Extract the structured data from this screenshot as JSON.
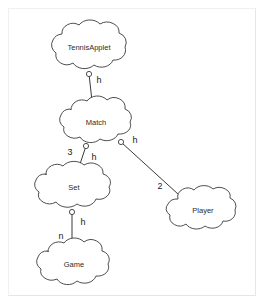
{
  "diagram": {
    "type": "cloud-class-diagram",
    "title": "",
    "background_color": "#ffffff",
    "stroke_color": "#3a3a3a",
    "text_color": "#2b2b2b",
    "nodes": [
      {
        "id": "tennisapplet",
        "label": "TennisApplet",
        "cx": 89,
        "cy": 48,
        "rx": 44,
        "ry": 24
      },
      {
        "id": "match",
        "label": "Match",
        "cx": 96,
        "cy": 123,
        "rx": 41,
        "ry": 23
      },
      {
        "id": "set",
        "label": "Set",
        "cx": 74,
        "cy": 188,
        "rx": 44,
        "ry": 23
      },
      {
        "id": "game",
        "label": "Game",
        "cx": 74,
        "cy": 265,
        "rx": 42,
        "ry": 23
      },
      {
        "id": "player",
        "label": "Player",
        "cx": 203,
        "cy": 211,
        "rx": 41,
        "ry": 22
      }
    ],
    "edges": [
      {
        "id": "tennisapplet-match",
        "from": "tennisapplet",
        "to": "match",
        "socket_label": "h",
        "multiplicity": ""
      },
      {
        "id": "match-set",
        "from": "match",
        "to": "set",
        "socket_label": "h",
        "multiplicity": "3"
      },
      {
        "id": "match-player",
        "from": "match",
        "to": "player",
        "socket_label": "h",
        "multiplicity": "2"
      },
      {
        "id": "set-game",
        "from": "set",
        "to": "game",
        "socket_label": "h",
        "multiplicity": "n"
      }
    ],
    "edge_labels": [
      {
        "id": "label-h-tennisapplet-match",
        "text": "h",
        "x": 99,
        "y": 81
      },
      {
        "id": "label-h-match-set",
        "text": "h",
        "x": 94,
        "y": 158
      },
      {
        "id": "label-mult-3",
        "text": "3",
        "x": 70,
        "y": 153
      },
      {
        "id": "label-h-match-player",
        "text": "h",
        "x": 135,
        "y": 141
      },
      {
        "id": "label-mult-2",
        "text": "2",
        "x": 160,
        "y": 187
      },
      {
        "id": "label-h-set-game",
        "text": "h",
        "x": 83,
        "y": 223
      },
      {
        "id": "label-mult-n",
        "text": "n",
        "x": 61,
        "y": 237
      }
    ]
  }
}
